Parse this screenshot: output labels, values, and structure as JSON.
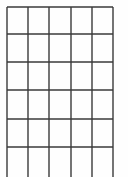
{
  "canvas": {
    "width": 128,
    "height": 177,
    "background_color": "#fefefe"
  },
  "figure": {
    "kind": "grid-table-outline",
    "line_color": "#3a3a3a",
    "line_width": 1.4,
    "columns": 5,
    "rows": 6,
    "bottom_row_cut_off": true,
    "has_bottom_border": false,
    "has_text": false,
    "has_fill": false
  },
  "chart_data": {
    "type": "table",
    "title": "",
    "xlabel": "",
    "ylabel": "",
    "grid": true,
    "legend": "none",
    "columns": 5,
    "rows": 6,
    "vertical_lines_x": [
      7,
      28,
      49,
      71,
      92,
      113
    ],
    "horizontal_lines_y": [
      7,
      34,
      62,
      90,
      119,
      147
    ],
    "vertical_line_extent_y": [
      7,
      177
    ],
    "horizontal_line_extent_x": [
      7,
      113
    ],
    "column_headers": [
      "",
      "",
      "",
      "",
      ""
    ],
    "values": [
      [
        "",
        "",
        "",
        "",
        ""
      ],
      [
        "",
        "",
        "",
        "",
        ""
      ],
      [
        "",
        "",
        "",
        "",
        ""
      ],
      [
        "",
        "",
        "",
        "",
        ""
      ],
      [
        "",
        "",
        "",
        "",
        ""
      ],
      [
        "",
        "",
        "",
        "",
        ""
      ]
    ]
  }
}
